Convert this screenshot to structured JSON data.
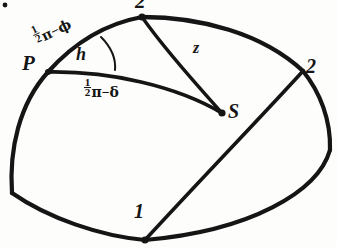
{
  "figure": {
    "kind": "spherical-triangle-diagram",
    "background_color": "#fdfdfc",
    "ink_color": "#151515"
  },
  "vertices": {
    "pole": {
      "label": "P",
      "name": "pole-point"
    },
    "top": {
      "label": "2",
      "name": "top-vertex"
    },
    "right": {
      "label": "2",
      "name": "right-vertex"
    },
    "bottom": {
      "label": "1",
      "name": "bottom-vertex"
    },
    "star": {
      "label": "S",
      "name": "star-point"
    }
  },
  "arc_labels": {
    "co_latitude": {
      "numerator": "1",
      "denominator": "2",
      "pi": "π",
      "minus": "−",
      "symbol": "ϕ"
    },
    "polar_distance": {
      "numerator": "1",
      "denominator": "2",
      "pi": "π",
      "minus": "−",
      "symbol": "δ"
    },
    "zenith_distance": {
      "label": "z"
    },
    "angle_at_pole": {
      "label": "h"
    }
  }
}
